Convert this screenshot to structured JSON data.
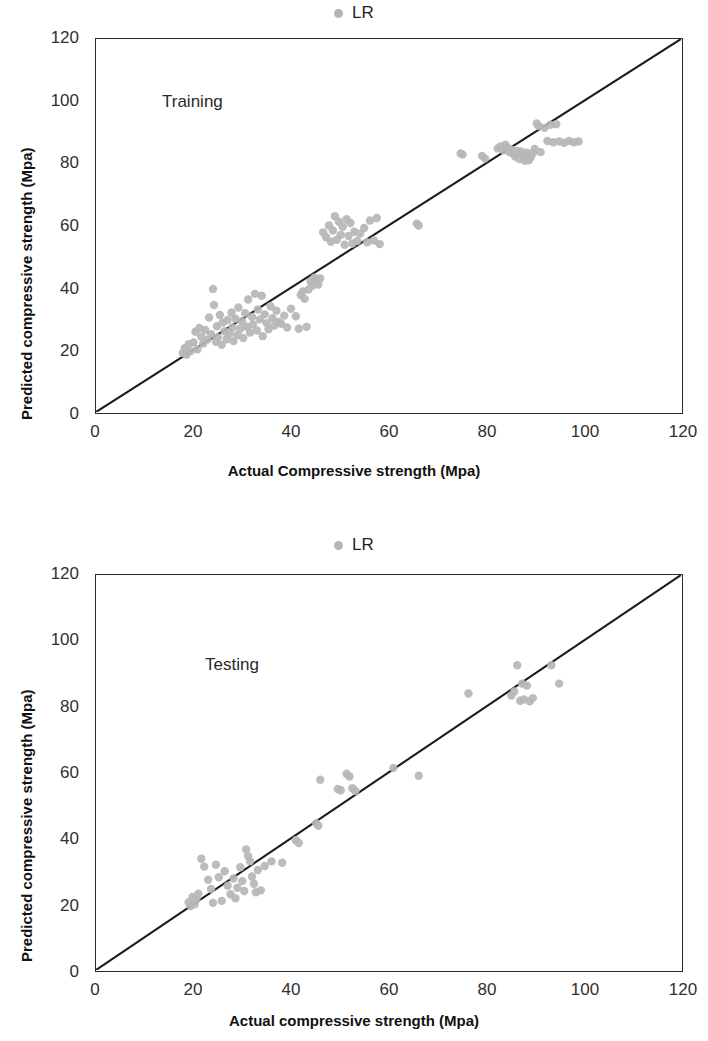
{
  "legend": {
    "label": "LR",
    "marker_color": "#b5b5b5",
    "marker": "circle"
  },
  "axis": {
    "y_title": "Predicted compressive strength (Mpa)",
    "x_title_training": "Actual Compressive strength (Mpa)",
    "x_title_testing": "Actual compressive strength (Mpa)",
    "ticks": [
      "0",
      "20",
      "40",
      "60",
      "80",
      "100",
      "120"
    ]
  },
  "annotations": {
    "training": "Training",
    "testing": "Testing"
  },
  "chart_data": [
    {
      "type": "scatter",
      "title": "Training",
      "subtitle": "",
      "xlabel": "Actual Compressive strength (Mpa)",
      "ylabel": "Predicted compressive strength (Mpa)",
      "xlim": [
        0,
        120
      ],
      "ylim": [
        0,
        120
      ],
      "xticks": [
        0,
        20,
        40,
        60,
        80,
        100,
        120
      ],
      "yticks": [
        0,
        20,
        40,
        60,
        80,
        100,
        120
      ],
      "grid": false,
      "legend": [
        "LR"
      ],
      "legend_position": "top-center",
      "marker_color": "#b6b6b6",
      "reference_line": {
        "type": "parity",
        "from": [
          0,
          0
        ],
        "to": [
          120,
          120
        ],
        "color": "#1b1b1b"
      },
      "series": [
        {
          "name": "LR",
          "points": [
            [
              17.8,
              19.0
            ],
            [
              18.2,
              20.5
            ],
            [
              18.6,
              18.4
            ],
            [
              19.0,
              21.8
            ],
            [
              19.4,
              19.6
            ],
            [
              20.0,
              22.4
            ],
            [
              20.4,
              25.8
            ],
            [
              20.8,
              20.2
            ],
            [
              21.2,
              27.0
            ],
            [
              21.6,
              24.2
            ],
            [
              22.0,
              22.0
            ],
            [
              22.4,
              26.4
            ],
            [
              22.8,
              23.2
            ],
            [
              23.2,
              30.4
            ],
            [
              23.6,
              25.0
            ],
            [
              24.0,
              39.6
            ],
            [
              24.2,
              34.4
            ],
            [
              24.6,
              22.6
            ],
            [
              24.8,
              27.6
            ],
            [
              25.0,
              24.0
            ],
            [
              25.4,
              31.2
            ],
            [
              25.8,
              21.6
            ],
            [
              26.0,
              28.8
            ],
            [
              26.4,
              26.0
            ],
            [
              26.8,
              23.4
            ],
            [
              27.0,
              29.6
            ],
            [
              27.4,
              25.2
            ],
            [
              27.8,
              32.0
            ],
            [
              28.0,
              27.2
            ],
            [
              28.2,
              22.8
            ],
            [
              28.6,
              30.0
            ],
            [
              29.0,
              24.8
            ],
            [
              29.2,
              33.6
            ],
            [
              29.6,
              26.8
            ],
            [
              30.0,
              29.2
            ],
            [
              30.2,
              23.8
            ],
            [
              30.6,
              31.8
            ],
            [
              31.0,
              27.4
            ],
            [
              31.2,
              36.2
            ],
            [
              31.6,
              25.6
            ],
            [
              32.0,
              30.6
            ],
            [
              32.2,
              28.2
            ],
            [
              32.6,
              38.0
            ],
            [
              33.0,
              26.2
            ],
            [
              33.2,
              33.0
            ],
            [
              33.6,
              29.8
            ],
            [
              34.0,
              37.4
            ],
            [
              34.2,
              24.4
            ],
            [
              34.6,
              31.4
            ],
            [
              35.0,
              28.6
            ],
            [
              35.4,
              26.6
            ],
            [
              35.8,
              34.0
            ],
            [
              36.2,
              30.2
            ],
            [
              36.6,
              27.8
            ],
            [
              37.0,
              32.6
            ],
            [
              37.4,
              29.0
            ],
            [
              38.0,
              28.4
            ],
            [
              38.6,
              31.0
            ],
            [
              39.2,
              27.2
            ],
            [
              40.0,
              33.2
            ],
            [
              41.0,
              30.8
            ],
            [
              41.6,
              26.8
            ],
            [
              42.0,
              37.6
            ],
            [
              42.4,
              38.8
            ],
            [
              42.8,
              36.4
            ],
            [
              43.2,
              27.4
            ],
            [
              43.6,
              39.4
            ],
            [
              44.0,
              42.0
            ],
            [
              44.4,
              40.6
            ],
            [
              44.8,
              43.2
            ],
            [
              45.2,
              42.6
            ],
            [
              45.6,
              41.0
            ],
            [
              46.0,
              43.0
            ],
            [
              46.6,
              57.8
            ],
            [
              47.2,
              56.2
            ],
            [
              47.8,
              60.0
            ],
            [
              48.2,
              54.8
            ],
            [
              48.6,
              58.4
            ],
            [
              49.0,
              63.0
            ],
            [
              49.4,
              55.4
            ],
            [
              49.8,
              61.2
            ],
            [
              50.2,
              57.0
            ],
            [
              50.6,
              59.6
            ],
            [
              51.0,
              53.8
            ],
            [
              51.4,
              62.0
            ],
            [
              51.8,
              56.6
            ],
            [
              52.2,
              60.8
            ],
            [
              52.6,
              54.2
            ],
            [
              53.0,
              58.0
            ],
            [
              53.6,
              55.0
            ],
            [
              54.2,
              57.4
            ],
            [
              55.0,
              59.2
            ],
            [
              55.6,
              54.6
            ],
            [
              56.2,
              61.6
            ],
            [
              57.0,
              55.2
            ],
            [
              57.6,
              62.4
            ],
            [
              58.2,
              54.0
            ],
            [
              65.8,
              60.6
            ],
            [
              66.2,
              60.0
            ],
            [
              74.8,
              83.2
            ],
            [
              75.2,
              82.8
            ],
            [
              79.2,
              82.4
            ],
            [
              79.8,
              81.6
            ],
            [
              82.4,
              84.8
            ],
            [
              83.0,
              85.4
            ],
            [
              83.6,
              84.2
            ],
            [
              84.0,
              86.0
            ],
            [
              84.4,
              85.0
            ],
            [
              84.8,
              83.6
            ],
            [
              85.2,
              84.4
            ],
            [
              85.6,
              83.0
            ],
            [
              86.0,
              82.2
            ],
            [
              86.4,
              84.0
            ],
            [
              86.8,
              81.4
            ],
            [
              87.2,
              83.8
            ],
            [
              87.6,
              82.6
            ],
            [
              88.0,
              80.8
            ],
            [
              88.4,
              83.4
            ],
            [
              88.8,
              81.0
            ],
            [
              89.2,
              82.0
            ],
            [
              89.6,
              83.2
            ],
            [
              90.0,
              84.6
            ],
            [
              90.4,
              92.8
            ],
            [
              90.8,
              92.0
            ],
            [
              91.2,
              83.6
            ],
            [
              92.0,
              91.4
            ],
            [
              92.6,
              87.2
            ],
            [
              93.2,
              92.4
            ],
            [
              93.8,
              86.8
            ],
            [
              94.4,
              92.6
            ],
            [
              95.0,
              87.0
            ],
            [
              96.0,
              86.6
            ],
            [
              97.0,
              87.2
            ],
            [
              98.0,
              86.8
            ],
            [
              99.0,
              87.0
            ]
          ]
        }
      ]
    },
    {
      "type": "scatter",
      "title": "Testing",
      "subtitle": "",
      "xlabel": "Actual compressive strength (Mpa)",
      "ylabel": "Predicted compressive strength (Mpa)",
      "xlim": [
        0,
        120
      ],
      "ylim": [
        0,
        120
      ],
      "xticks": [
        0,
        20,
        40,
        60,
        80,
        100,
        120
      ],
      "yticks": [
        0,
        20,
        40,
        60,
        80,
        100,
        120
      ],
      "grid": false,
      "legend": [
        "LR"
      ],
      "legend_position": "top-center",
      "marker_color": "#b6b6b6",
      "reference_line": {
        "type": "parity",
        "from": [
          0,
          0
        ],
        "to": [
          120,
          120
        ],
        "color": "#1b1b1b"
      },
      "series": [
        {
          "name": "LR",
          "points": [
            [
              19.0,
              20.6
            ],
            [
              19.4,
              19.4
            ],
            [
              19.8,
              22.2
            ],
            [
              20.2,
              20.0
            ],
            [
              20.6,
              21.4
            ],
            [
              21.0,
              23.2
            ],
            [
              21.6,
              33.8
            ],
            [
              22.2,
              31.4
            ],
            [
              23.0,
              27.4
            ],
            [
              23.6,
              24.6
            ],
            [
              24.0,
              20.4
            ],
            [
              24.6,
              32.0
            ],
            [
              25.2,
              28.2
            ],
            [
              25.8,
              21.0
            ],
            [
              26.4,
              30.0
            ],
            [
              27.0,
              25.6
            ],
            [
              27.6,
              23.0
            ],
            [
              28.2,
              27.8
            ],
            [
              28.6,
              21.8
            ],
            [
              29.0,
              25.0
            ],
            [
              29.6,
              31.2
            ],
            [
              30.0,
              27.0
            ],
            [
              30.4,
              24.0
            ],
            [
              30.8,
              36.6
            ],
            [
              31.2,
              34.6
            ],
            [
              31.6,
              33.0
            ],
            [
              32.0,
              28.4
            ],
            [
              32.4,
              26.2
            ],
            [
              32.8,
              23.6
            ],
            [
              33.2,
              30.4
            ],
            [
              33.8,
              24.2
            ],
            [
              34.6,
              31.6
            ],
            [
              36.0,
              33.0
            ],
            [
              38.2,
              32.6
            ],
            [
              41.0,
              39.4
            ],
            [
              41.6,
              38.6
            ],
            [
              45.2,
              44.6
            ],
            [
              45.6,
              43.8
            ],
            [
              46.0,
              57.8
            ],
            [
              49.6,
              55.0
            ],
            [
              50.2,
              54.6
            ],
            [
              51.4,
              59.6
            ],
            [
              52.0,
              58.8
            ],
            [
              52.6,
              55.2
            ],
            [
              53.2,
              54.4
            ],
            [
              61.0,
              61.4
            ],
            [
              66.2,
              59.0
            ],
            [
              76.4,
              84.0
            ],
            [
              85.2,
              83.4
            ],
            [
              85.8,
              84.6
            ],
            [
              86.4,
              92.6
            ],
            [
              87.0,
              81.8
            ],
            [
              87.4,
              87.0
            ],
            [
              87.8,
              82.2
            ],
            [
              88.4,
              86.4
            ],
            [
              89.0,
              81.6
            ],
            [
              89.6,
              82.6
            ],
            [
              93.4,
              92.6
            ],
            [
              95.0,
              87.0
            ]
          ]
        }
      ]
    }
  ]
}
